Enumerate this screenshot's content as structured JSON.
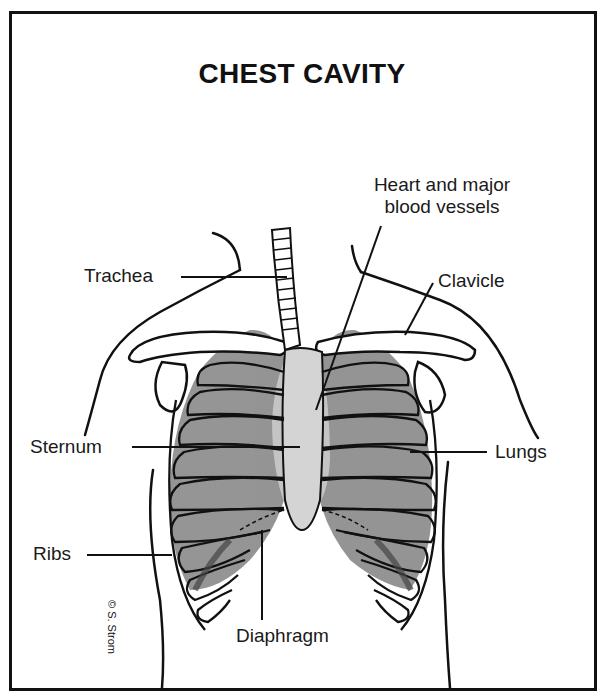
{
  "diagram": {
    "title": "CHEST CAVITY",
    "labels": {
      "heart": {
        "line1": "Heart and major",
        "line2": "blood vessels"
      },
      "trachea": "Trachea",
      "clavicle": "Clavicle",
      "sternum": "Sternum",
      "lungs": "Lungs",
      "ribs": "Ribs",
      "diaphragm": "Diaphragm"
    },
    "signature": "© S. Strom",
    "colors": {
      "ink": "#111111",
      "lung_fill": "#8f8f8f",
      "heart_fill": "#c4c4c4",
      "background": "#ffffff"
    }
  }
}
